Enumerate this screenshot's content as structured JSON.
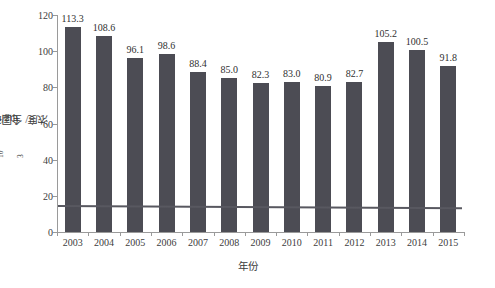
{
  "chart_data": {
    "type": "bar",
    "title": "",
    "subtitle": "",
    "xlabel": "年份",
    "ylabel": "全国平均城市PM10浓度/（μg/m3）",
    "ylabel_parts": {
      "prefix": "全国平均城市PM",
      "sub": "10",
      "middle": "浓度/（μg/m",
      "sup": "3",
      "suffix": "）"
    },
    "categories": [
      "2003",
      "2004",
      "2005",
      "2006",
      "2007",
      "2008",
      "2009",
      "2010",
      "2011",
      "2012",
      "2013",
      "2014",
      "2015"
    ],
    "values": [
      113.3,
      108.6,
      96.1,
      98.6,
      88.4,
      85.0,
      82.3,
      83.0,
      80.9,
      82.7,
      105.2,
      100.5,
      91.8
    ],
    "value_labels": [
      "113.3",
      "108.6",
      "96.1",
      "98.6",
      "88.4",
      "85.0",
      "82.3",
      "83.0",
      "80.9",
      "82.7",
      "105.2",
      "100.5",
      "91.8"
    ],
    "series": [
      {
        "name": "全国平均城市PM10浓度",
        "values": [
          113.3,
          108.6,
          96.1,
          98.6,
          88.4,
          85.0,
          82.3,
          83.0,
          80.9,
          82.7,
          105.2,
          100.5,
          91.8
        ],
        "color": "#4c4c54",
        "kind": "bar"
      },
      {
        "name": "参考线",
        "values": [
          15.0,
          14.9,
          14.8,
          14.7,
          14.6,
          14.5,
          14.4,
          14.3,
          14.2,
          14.1,
          14.0,
          13.9,
          13.8
        ],
        "color": "#585860",
        "kind": "line"
      }
    ],
    "ylim": [
      0,
      120
    ],
    "ytick_values": [
      0,
      20,
      40,
      60,
      80,
      100,
      120
    ],
    "ytick_labels": [
      "0",
      "20",
      "40",
      "60",
      "80",
      "100",
      "120"
    ],
    "grid": false,
    "legend": "none",
    "axis_color": "#9a9a9a",
    "background": "#ffffff"
  }
}
